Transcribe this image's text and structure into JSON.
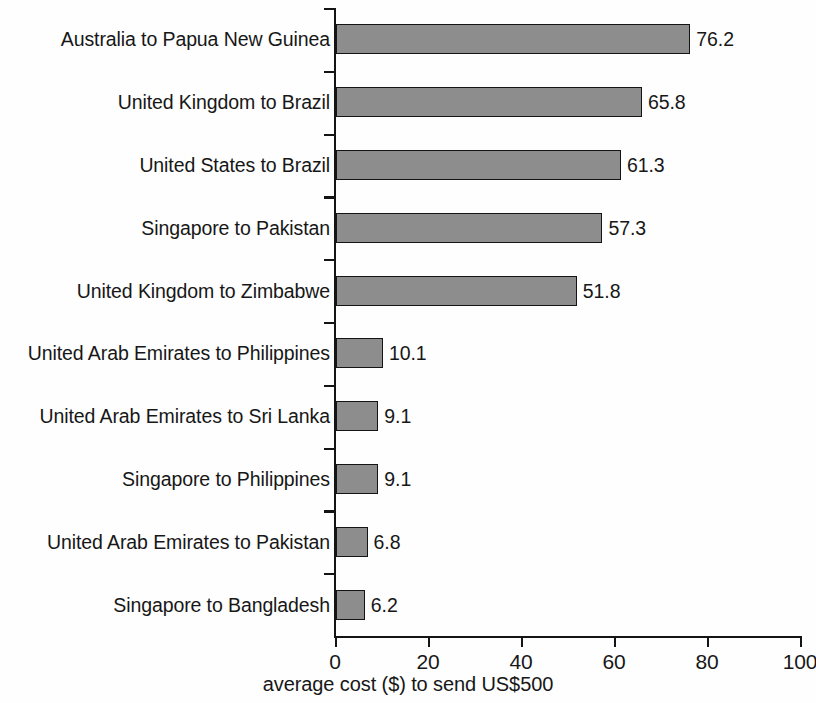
{
  "chart_data": {
    "type": "bar",
    "orientation": "horizontal",
    "title": "",
    "xlabel": "average cost ($) to send US$500",
    "ylabel": "",
    "xlim": [
      0,
      100
    ],
    "xticks": [
      "0",
      "20",
      "40",
      "60",
      "80",
      "100"
    ],
    "grid": false,
    "legend": null,
    "categories": [
      "Australia to Papua New Guinea",
      "United Kingdom to Brazil",
      "United States to Brazil",
      "Singapore to Pakistan",
      "United Kingdom to Zimbabwe",
      "United Arab Emirates to Philippines",
      "United Arab Emirates to Sri Lanka",
      "Singapore to Philippines",
      "United Arab Emirates to Pakistan",
      "Singapore to Bangladesh"
    ],
    "values": [
      76.2,
      65.8,
      61.3,
      57.3,
      51.8,
      10.1,
      9.1,
      9.1,
      6.8,
      6.2
    ],
    "value_labels": [
      "76.2",
      "65.8",
      "61.3",
      "57.3",
      "51.8",
      "10.1",
      "9.1",
      "9.1",
      "6.8",
      "6.2"
    ],
    "colors": {
      "bar_fill": "#8d8d8d",
      "bar_border": "#141414",
      "axis": "#141414",
      "text": "#171717",
      "background": "#fefefe"
    }
  }
}
